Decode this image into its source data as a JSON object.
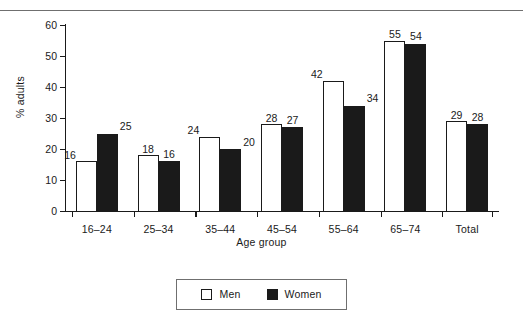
{
  "chart_data": {
    "type": "bar",
    "title": "",
    "xlabel": "Age group",
    "ylabel": "% adults",
    "ylim": [
      0,
      60
    ],
    "yticks": [
      0,
      10,
      20,
      30,
      40,
      50,
      60
    ],
    "grid": false,
    "legend_position": "bottom-center",
    "categories": [
      "16–24",
      "25–34",
      "35–44",
      "45–54",
      "55–64",
      "65–74",
      "Total"
    ],
    "series": [
      {
        "name": "Men",
        "fill": "#ffffff",
        "values": [
          16,
          18,
          24,
          28,
          42,
          55,
          29
        ]
      },
      {
        "name": "Women",
        "fill": "#1a1a1a",
        "values": [
          25,
          16,
          20,
          27,
          34,
          54,
          28
        ]
      }
    ]
  },
  "axes": {
    "y_title": "% adults",
    "x_title": "Age group",
    "y_tick_labels": [
      "0",
      "10",
      "20",
      "30",
      "40",
      "50",
      "60"
    ]
  },
  "legend": {
    "items": [
      {
        "label": "Men",
        "swatch": "open-square-swatch"
      },
      {
        "label": "Women",
        "swatch": "filled-square-swatch"
      }
    ]
  },
  "colors": {
    "men": "#ffffff",
    "women": "#1a1a1a",
    "axis": "#1a1a1a",
    "rule": "#6f6f6f",
    "background": "#ffffff"
  }
}
